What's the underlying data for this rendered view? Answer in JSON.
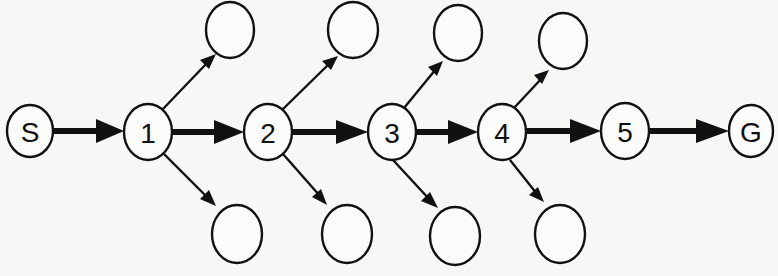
{
  "diagram": {
    "type": "search-tree-path",
    "main_path": [
      "S",
      "1",
      "2",
      "3",
      "4",
      "5",
      "G"
    ],
    "nodes": {
      "S": {
        "label": "S",
        "cx": 30,
        "cy": 131,
        "rx": 23,
        "ry": 26
      },
      "n1": {
        "label": "1",
        "cx": 148,
        "cy": 132,
        "rx": 24,
        "ry": 28
      },
      "n2": {
        "label": "2",
        "cx": 268,
        "cy": 132,
        "rx": 24,
        "ry": 28
      },
      "n3": {
        "label": "3",
        "cx": 392,
        "cy": 131,
        "rx": 24,
        "ry": 28
      },
      "n4": {
        "label": "4",
        "cx": 502,
        "cy": 132,
        "rx": 24,
        "ry": 28
      },
      "n5": {
        "label": "5",
        "cx": 625,
        "cy": 131,
        "rx": 24,
        "ry": 28
      },
      "G": {
        "label": "G",
        "cx": 751,
        "cy": 131,
        "rx": 22,
        "ry": 26
      }
    },
    "branches_top": [
      {
        "from": "1",
        "cx": 230,
        "cy": 30
      },
      {
        "from": "2",
        "cx": 353,
        "cy": 30
      },
      {
        "from": "3",
        "cx": 458,
        "cy": 33
      },
      {
        "from": "4",
        "cx": 563,
        "cy": 41
      }
    ],
    "branches_bottom": [
      {
        "from": "1",
        "cx": 237,
        "cy": 234
      },
      {
        "from": "2",
        "cx": 347,
        "cy": 234
      },
      {
        "from": "3",
        "cx": 455,
        "cy": 236
      },
      {
        "from": "4",
        "cx": 560,
        "cy": 234
      }
    ]
  }
}
